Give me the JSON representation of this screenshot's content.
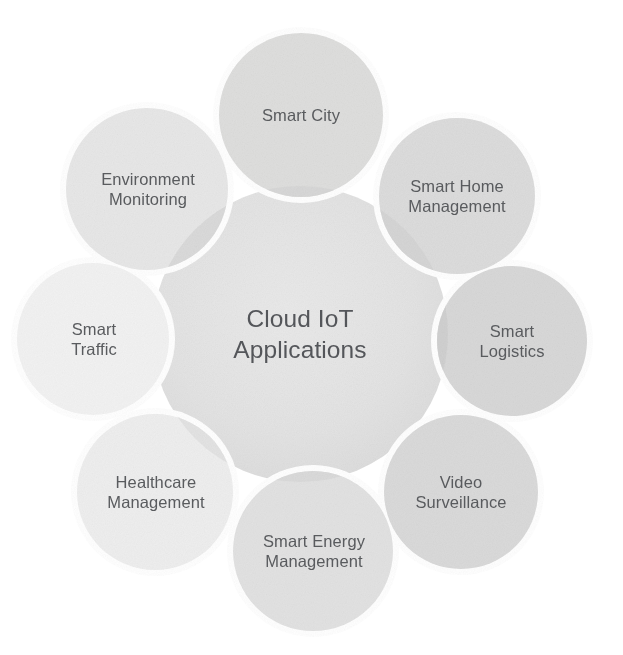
{
  "diagram": {
    "title": "Cloud IoT Applications",
    "type": "hub-and-spoke-circles",
    "background_color": "#ffffff",
    "text_color": "#595b5e",
    "hub": {
      "label": "Cloud IoT\nApplications",
      "line1": "Cloud IoT",
      "line2": "Applications",
      "fill_color": "#e3e3e3",
      "cx": 300,
      "cy": 334,
      "r": 148
    },
    "ring_outline_color": "#ffffff",
    "overlap_shade_color": "#cfcfcf",
    "satellites": [
      {
        "id": "smart-city",
        "label": "Smart City",
        "angle_deg": 270,
        "cx": 301,
        "cy": 115,
        "r": 82,
        "fill_color": "#dededd"
      },
      {
        "id": "smart-home-management",
        "label": "Smart Home\nManagement",
        "angle_deg": 315,
        "cx": 457,
        "cy": 196,
        "r": 78,
        "fill_color": "#dcdcdc"
      },
      {
        "id": "smart-logistics",
        "label": "Smart\nLogistics",
        "angle_deg": 0,
        "cx": 512,
        "cy": 341,
        "r": 75,
        "fill_color": "#d8d8d8"
      },
      {
        "id": "video-surveillance",
        "label": "Video\nSurveillance",
        "angle_deg": 45,
        "cx": 461,
        "cy": 492,
        "r": 77,
        "fill_color": "#dadada"
      },
      {
        "id": "smart-energy-management",
        "label": "Smart Energy\nManagement",
        "angle_deg": 90,
        "cx": 313,
        "cy": 551,
        "r": 80,
        "fill_color": "#e2e2e2"
      },
      {
        "id": "healthcare-management",
        "label": "Healthcare\nManagement",
        "angle_deg": 135,
        "cx": 155,
        "cy": 492,
        "r": 78,
        "fill_color": "#eeeeee"
      },
      {
        "id": "smart-traffic",
        "label": "Smart\nTraffic",
        "angle_deg": 180,
        "cx": 93,
        "cy": 339,
        "r": 76,
        "fill_color": "#f2f2f2"
      },
      {
        "id": "environment-monitoring",
        "label": "Environment\nMonitoring",
        "angle_deg": 225,
        "cx": 147,
        "cy": 189,
        "r": 81,
        "fill_color": "#e7e7e7"
      }
    ]
  }
}
